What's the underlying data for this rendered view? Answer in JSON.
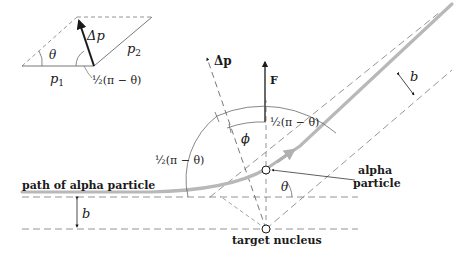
{
  "diagram": {
    "type": "rutherford-scattering-geometry",
    "inset": {
      "labels": {
        "delta_p": "Δp",
        "theta": "θ",
        "p1": "p",
        "p1_sub": "1",
        "p2": "p",
        "p2_sub": "2",
        "half_angle": "½(π − θ)"
      }
    },
    "main": {
      "labels": {
        "delta_p_vec": "Δp",
        "force": "F",
        "half_angle_top": "½(π − θ)",
        "half_angle_left": "½(π − θ)",
        "phi": "ϕ",
        "theta": "θ",
        "b_lower": "b",
        "b_upper": "b",
        "path": "path of alpha particle",
        "alpha_line1": "alpha",
        "alpha_line2": "particle",
        "nucleus": "target nucleus"
      },
      "colors": {
        "ink": "#1a1a1a",
        "path": "#b8b8b8",
        "dash": "#7a7a7a"
      }
    }
  }
}
